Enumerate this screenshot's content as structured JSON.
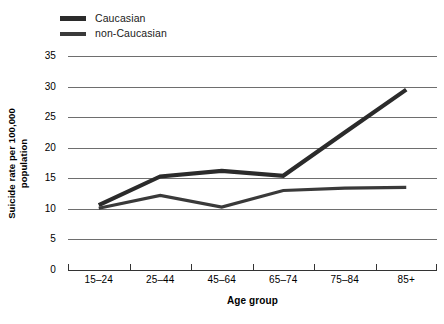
{
  "chart_data": {
    "type": "line",
    "title": "",
    "xlabel": "Age group",
    "ylabel": "Suicide rate per 100,000 population",
    "ylabel_line1": "Suicide rate per 100,000",
    "ylabel_line2": "population",
    "categories": [
      "15–24",
      "25–44",
      "45–64",
      "65–74",
      "75–84",
      "85+"
    ],
    "ylim": [
      0,
      35
    ],
    "yticks": [
      0,
      5,
      10,
      15,
      20,
      25,
      30,
      35
    ],
    "ytick_labels": [
      "0",
      "5",
      "10",
      "15",
      "20",
      "25",
      "30",
      "35"
    ],
    "grid": true,
    "grid_axis": "y",
    "legend_position": "top-left",
    "series": [
      {
        "name": "Caucasian",
        "color": "#2b2b2b",
        "line_width": 4.2,
        "values": [
          10.6,
          15.3,
          16.2,
          15.4,
          22.5,
          29.5
        ]
      },
      {
        "name": "non-Caucasian",
        "color": "#3a3a3a",
        "line_width": 3.2,
        "values": [
          10.1,
          12.2,
          10.3,
          13.0,
          13.4,
          13.5
        ]
      }
    ]
  },
  "legend": {
    "items": [
      {
        "label": "Caucasian"
      },
      {
        "label": "non-Caucasian"
      }
    ]
  },
  "colors": {
    "series_caucasian": "#2b2b2b",
    "series_non_caucasian": "#3a3a3a",
    "gridline": "#6e6e6e",
    "axis": "#333333",
    "background": "#ffffff"
  }
}
